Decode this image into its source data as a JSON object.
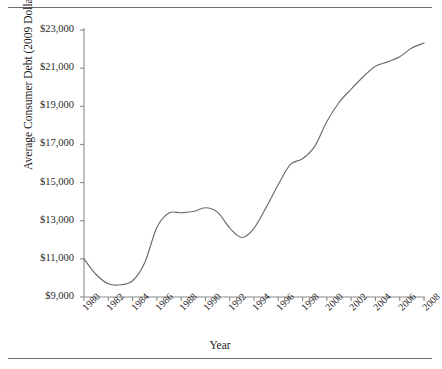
{
  "figure": {
    "has_top_rule": true,
    "has_bottom_rule": true,
    "line_color": "#6b6b6b",
    "axis_color": "#8a8a8a",
    "background": "#ffffff"
  },
  "chart_data": {
    "type": "line",
    "title": "",
    "xlabel": "Year",
    "ylabel": "Average Consumer Debt (2009 Dollars)",
    "xlim": [
      1980,
      2008
    ],
    "ylim": [
      9000,
      23000
    ],
    "grid": false,
    "legend": "none",
    "y_tick_labels": [
      "$23,000",
      "$21,000",
      "$19,000",
      "$17,000",
      "$15,000",
      "$13,000",
      "$11,000",
      "$9,000"
    ],
    "y_tick_values": [
      23000,
      21000,
      19000,
      17000,
      15000,
      13000,
      11000,
      9000
    ],
    "x_tick_labels": [
      "1980",
      "1982",
      "1984",
      "1986",
      "1988",
      "1990",
      "1992",
      "1994",
      "1996",
      "1998",
      "2000",
      "2002",
      "2004",
      "2006",
      "2008"
    ],
    "x_tick_values": [
      1980,
      1982,
      1984,
      1986,
      1988,
      1990,
      1992,
      1994,
      1996,
      1998,
      2000,
      2002,
      2004,
      2006,
      2008
    ],
    "series": [
      {
        "name": "Average Consumer Debt",
        "x": [
          1980,
          1981,
          1982,
          1983,
          1984,
          1985,
          1986,
          1987,
          1988,
          1989,
          1990,
          1991,
          1992,
          1993,
          1994,
          1995,
          1996,
          1997,
          1998,
          1999,
          2000,
          2001,
          2002,
          2003,
          2004,
          2005,
          2006,
          2007,
          2008
        ],
        "values": [
          11000,
          10180,
          9690,
          9640,
          9850,
          10800,
          12650,
          13400,
          13420,
          13480,
          13680,
          13450,
          12620,
          12120,
          12600,
          13700,
          14900,
          15950,
          16250,
          16900,
          18200,
          19200,
          19900,
          20550,
          21100,
          21330,
          21600,
          22050,
          22320
        ]
      }
    ]
  }
}
